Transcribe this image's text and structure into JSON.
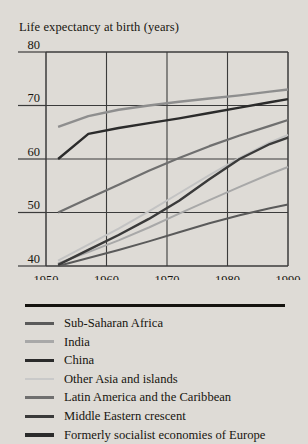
{
  "figure": {
    "title": "Life expectancy at birth (years)",
    "background_color": "#dedbd6",
    "text_color": "#17150f"
  },
  "chart_data": {
    "type": "line",
    "title": "Life expectancy at birth (years)",
    "xlabel": "",
    "ylabel": "Life expectancy at birth (years)",
    "xlim": [
      1950,
      1990
    ],
    "ylim": [
      40,
      80
    ],
    "xticks": [
      1950,
      1960,
      1970,
      1980,
      1990
    ],
    "yticks": [
      40,
      50,
      60,
      70,
      80
    ],
    "xtick_labels": [
      "1950",
      "1960",
      "1970",
      "1980",
      "1990"
    ],
    "ytick_labels": [
      "40",
      "50",
      "60",
      "70",
      "80"
    ],
    "grid": true,
    "legend_position": "below",
    "x": [
      1952,
      1957,
      1962,
      1967,
      1972,
      1977,
      1982,
      1987,
      1990
    ],
    "series": [
      {
        "name": "Sub-Saharan Africa",
        "color": "#5a5a5a",
        "width": 2.0,
        "values": [
          40.0,
          41.5,
          43.0,
          44.6,
          46.3,
          48.0,
          49.5,
          50.8,
          51.5
        ]
      },
      {
        "name": "India",
        "color": "#a8a8a8",
        "width": 2.0,
        "values": [
          40.5,
          42.6,
          44.8,
          47.2,
          49.8,
          52.3,
          54.8,
          57.2,
          58.5
        ]
      },
      {
        "name": "China",
        "color": "#2b2b2b",
        "width": 2.4,
        "values": [
          60.0,
          64.7,
          65.8,
          66.7,
          67.6,
          68.6,
          69.6,
          70.6,
          71.2
        ]
      },
      {
        "name": "Other Asia and islands",
        "color": "#c3c3c3",
        "width": 2.0,
        "values": [
          41.0,
          44.0,
          47.0,
          50.2,
          53.6,
          57.0,
          60.2,
          63.1,
          64.5
        ]
      },
      {
        "name": "Latin America and the Caribbean",
        "color": "#6f6f6f",
        "width": 2.2,
        "values": [
          50.0,
          52.6,
          55.2,
          57.8,
          60.2,
          62.4,
          64.4,
          66.2,
          67.3
        ]
      },
      {
        "name": "Middle Eastern crescent",
        "color": "#3a3a3a",
        "width": 2.4,
        "values": [
          40.2,
          43.0,
          45.8,
          48.8,
          52.2,
          56.2,
          60.0,
          62.8,
          64.0
        ]
      },
      {
        "name": "Formerly socialist economies of Europe",
        "color": "#8e8e8e",
        "width": 2.4,
        "values": [
          66.0,
          68.0,
          69.2,
          70.0,
          70.7,
          71.3,
          71.9,
          72.6,
          73.0
        ]
      }
    ]
  },
  "legend": {
    "items": [
      {
        "label": "Sub-Saharan Africa",
        "color": "#5a5a5a",
        "thickness": "3px"
      },
      {
        "label": "India",
        "color": "#a8a8a8",
        "thickness": "3px"
      },
      {
        "label": "China",
        "color": "#2b2b2b",
        "thickness": "3.4px"
      },
      {
        "label": "Other Asia and islands",
        "color": "#c9c9c9",
        "thickness": "2.6px"
      },
      {
        "label": "Latin America and the Caribbean",
        "color": "#6f6f6f",
        "thickness": "3px"
      },
      {
        "label": "Middle Eastern crescent",
        "color": "#3a3a3a",
        "thickness": "3.4px"
      },
      {
        "label": "Formerly socialist economies of Europe",
        "color": "#2b2b2b",
        "thickness": "3.4px"
      }
    ]
  }
}
